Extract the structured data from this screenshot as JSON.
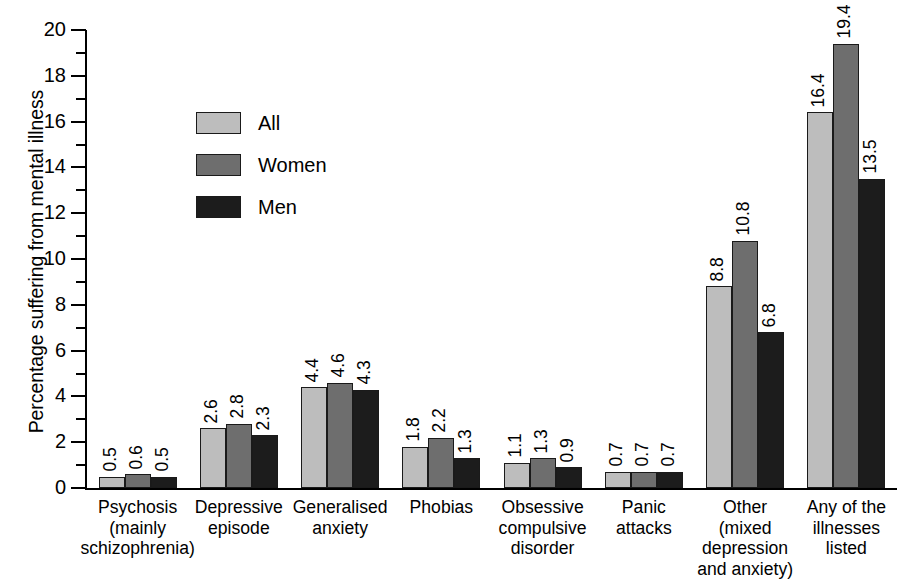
{
  "chart_data": {
    "type": "bar",
    "title": "",
    "xlabel": "",
    "ylabel": "Percentage suffering from mental illness",
    "ylim": [
      0,
      20
    ],
    "ytick_step": 2,
    "yticks": [
      0,
      2,
      4,
      6,
      8,
      10,
      12,
      14,
      16,
      18,
      20
    ],
    "minor_ticks": [
      1,
      3,
      5,
      7,
      9,
      11,
      13,
      15,
      17,
      19
    ],
    "grid": false,
    "legend_position": "inside-upper-left",
    "data_labels": true,
    "categories": [
      "Psychosis (mainly schizophrenia)",
      "Depressive episode",
      "Generalised anxiety",
      "Phobias",
      "Obsessive compulsive disorder",
      "Panic attacks",
      "Other (mixed depression and anxiety)",
      "Any of the illnesses listed"
    ],
    "category_lines": [
      [
        "Psychosis",
        "(mainly",
        "schizophrenia)"
      ],
      [
        "Depressive",
        "episode"
      ],
      [
        "Generalised",
        "anxiety"
      ],
      [
        "Phobias"
      ],
      [
        "Obsessive",
        "compulsive",
        "disorder"
      ],
      [
        "Panic",
        "attacks"
      ],
      [
        "Other",
        "(mixed",
        "depression",
        "and anxiety)"
      ],
      [
        "Any of the",
        "illnesses",
        "listed"
      ]
    ],
    "series": [
      {
        "name": "All",
        "color": "#bdbdbd",
        "values": [
          0.5,
          2.6,
          4.4,
          1.8,
          1.1,
          0.7,
          8.8,
          16.4
        ]
      },
      {
        "name": "Women",
        "color": "#6e6e6e",
        "values": [
          0.6,
          2.8,
          4.6,
          2.2,
          1.3,
          0.7,
          10.8,
          19.4
        ]
      },
      {
        "name": "Men",
        "color": "#1c1c1c",
        "values": [
          0.5,
          2.3,
          4.3,
          1.3,
          0.9,
          0.7,
          6.8,
          13.5
        ]
      }
    ]
  },
  "legend": {
    "items": [
      {
        "label": "All"
      },
      {
        "label": "Women"
      },
      {
        "label": "Men"
      }
    ]
  },
  "axis": {
    "y_title": "Percentage suffering from mental illness"
  }
}
